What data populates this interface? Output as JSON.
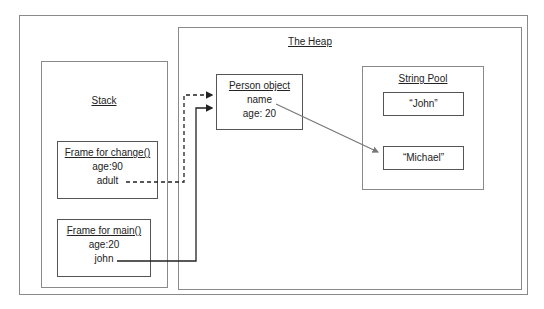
{
  "diagram": {
    "heap": {
      "title": "The Heap"
    },
    "stack": {
      "title": "Stack"
    },
    "person_object": {
      "title": "Person object",
      "fields": [
        "name",
        "age: 20"
      ]
    },
    "string_pool": {
      "title": "String Pool",
      "strings": [
        "“John”",
        "“Michael”"
      ]
    },
    "frames": [
      {
        "title": "Frame for change()",
        "vars": [
          "age:90",
          "adult"
        ]
      },
      {
        "title": "Frame for main()",
        "vars": [
          "age:20",
          "john"
        ]
      }
    ],
    "references": [
      {
        "from": "adult",
        "to": "Person object",
        "style": "dashed"
      },
      {
        "from": "john",
        "to": "Person object",
        "style": "solid"
      },
      {
        "from": "name",
        "to": "“Michael”",
        "style": "solid-gray"
      }
    ],
    "colors": {
      "border": "#8a8a8a",
      "arrow": "#222222",
      "pointer_gray": "#777777"
    }
  }
}
